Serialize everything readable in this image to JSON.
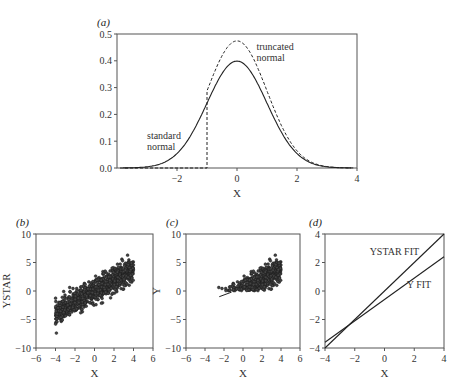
{
  "chart_data": [
    {
      "id": "a",
      "panel_label": "(a)",
      "type": "line",
      "title": "",
      "xlabel": "X",
      "ylabel": "",
      "xlim": [
        -4,
        4
      ],
      "ylim": [
        0,
        0.5
      ],
      "xticks": [
        -2,
        0,
        2,
        4
      ],
      "yticks": [
        0.0,
        0.1,
        0.2,
        0.3,
        0.4,
        0.5
      ],
      "ytick_labels": [
        "0.0",
        "0.1",
        "0.2",
        "0.3",
        "0.4",
        "0.5"
      ],
      "grid": false,
      "series": [
        {
          "name": "standard normal",
          "style": "solid",
          "function": "normal_pdf",
          "truncate_below": null
        },
        {
          "name": "truncated normal",
          "style": "dashed",
          "function": "normal_pdf_truncated",
          "truncate_below": -1
        }
      ],
      "annotations": [
        {
          "text": [
            "standard",
            "normal"
          ],
          "x": -3.0,
          "y": 0.11
        },
        {
          "text": [
            "truncated",
            "normal"
          ],
          "x": 0.65,
          "y": 0.44
        }
      ]
    },
    {
      "id": "b",
      "panel_label": "(b)",
      "type": "scatter",
      "xlabel": "X",
      "ylabel": "YSTAR",
      "xlim": [
        -6,
        6
      ],
      "ylim": [
        -10,
        10
      ],
      "xticks": [
        -6,
        -4,
        -2,
        0,
        2,
        4,
        6
      ],
      "yticks": [
        -10,
        -5,
        0,
        5,
        10
      ],
      "grid": false,
      "description": "Latent YSTAR = X + noise, X uniform on [-4,4], roughly 1000 points",
      "trend": {
        "slope": 1.0,
        "intercept": 0.0,
        "noise_sd": 1.0
      },
      "x_range_points": [
        -4,
        4
      ],
      "n_points": 1000
    },
    {
      "id": "c",
      "panel_label": "(c)",
      "type": "scatter",
      "xlabel": "X",
      "ylabel": "Y",
      "xlim": [
        -6,
        6
      ],
      "ylim": [
        -10,
        10
      ],
      "xticks": [
        -6,
        -4,
        -2,
        0,
        2,
        4,
        6
      ],
      "yticks": [
        -10,
        -5,
        0,
        5,
        10
      ],
      "grid": false,
      "description": "Observed Y = YSTAR truncated at 0 (only YSTAR > 0 kept), with fitted line",
      "truncation_point": 0,
      "fit_line": {
        "x": [
          -2.5,
          -1.2
        ],
        "y": [
          -1.0,
          -0.2
        ]
      },
      "n_points": 1000
    },
    {
      "id": "d",
      "panel_label": "(d)",
      "type": "line",
      "xlabel": "X",
      "ylabel": "",
      "xlim": [
        -4,
        4
      ],
      "ylim": [
        -4,
        4
      ],
      "xticks": [
        -4,
        -2,
        0,
        2,
        4
      ],
      "yticks": [
        -4,
        -2,
        0,
        2,
        4
      ],
      "grid": false,
      "series": [
        {
          "name": "YSTAR FIT",
          "x": [
            -4,
            4
          ],
          "y": [
            -4.0,
            4.0
          ]
        },
        {
          "name": "Y FIT",
          "x": [
            -4,
            4
          ],
          "y": [
            -3.6,
            2.4
          ]
        }
      ],
      "annotations": [
        {
          "text": "YSTAR FIT",
          "x": -1.0,
          "y": 2.5
        },
        {
          "text": "Y FIT",
          "x": 1.5,
          "y": 0.2
        }
      ]
    }
  ],
  "layout": {
    "panels": {
      "a": {
        "x": 117,
        "y": 34,
        "w": 240,
        "h": 134
      },
      "b": {
        "x": 36,
        "y": 234,
        "w": 117,
        "h": 114
      },
      "c": {
        "x": 186,
        "y": 234,
        "w": 114,
        "h": 114
      },
      "d": {
        "x": 325,
        "y": 234,
        "w": 119,
        "h": 114
      }
    },
    "colors": {
      "axis": "#555555",
      "line": "#222222",
      "point": "#1a1a1a"
    }
  }
}
